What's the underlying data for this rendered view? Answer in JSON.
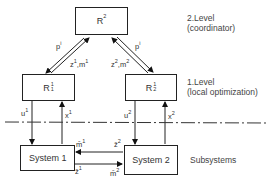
{
  "diagram": {
    "type": "hierarchical-control",
    "nodes": {
      "coordinator": {
        "base": "R",
        "sup": "2"
      },
      "local_1": {
        "base": "R",
        "sup": "1",
        "sub": "1"
      },
      "local_2": {
        "base": "R",
        "sup": "1",
        "sub": "2"
      },
      "system_1": {
        "label": "System 1"
      },
      "system_2": {
        "label": "System 2"
      }
    },
    "edges": {
      "p_left": {
        "base": "p",
        "sup": "i"
      },
      "zm_left": {
        "base": "z",
        "sup": "1",
        "mid": ",m",
        "sup2": "1"
      },
      "p_right": {
        "base": "p",
        "sup": "i"
      },
      "zm_right": {
        "base": "z",
        "sup": "2",
        "mid": ",m",
        "sup2": "2"
      },
      "u1": {
        "base": "u",
        "sup": "1"
      },
      "x1": {
        "base": "x",
        "sup": "1"
      },
      "u2": {
        "base": "u",
        "sup": "2"
      },
      "x2": {
        "base": "x",
        "sup": "2"
      },
      "m_bar_1": {
        "base": "m̄",
        "sup": "1"
      },
      "z_bar_2": {
        "base": "z̄",
        "sup": "2"
      },
      "z_bar_1": {
        "base": "z̄",
        "sup": "1"
      },
      "m_bar_2": {
        "base": "m̄",
        "sup": "2"
      }
    },
    "levels": {
      "level2_title": "2.Level",
      "level2_desc": "(coordinator)",
      "level1_title": "1.Level",
      "level1_desc": "(local optimization)",
      "subsystems": "Subsystems"
    }
  }
}
